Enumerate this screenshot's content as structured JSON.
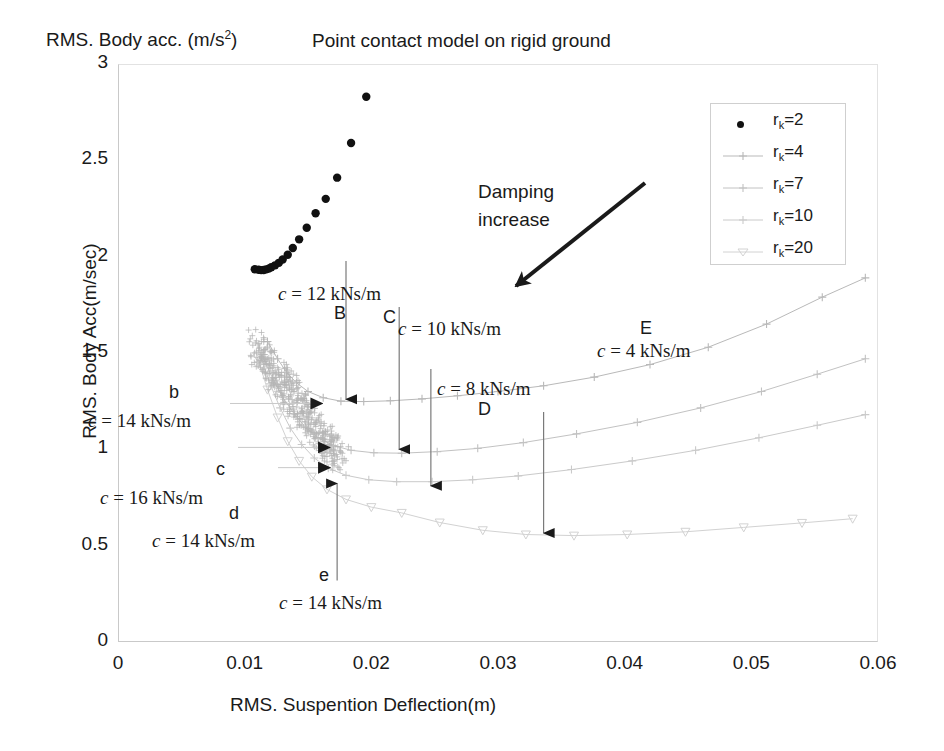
{
  "chart_data": {
    "type": "scatter",
    "title": "Point contact model on rigid ground",
    "xlabel": "RMS. Suspention Deflection(m)",
    "ylabel": "RMS. Body Acc(m/sec)",
    "ylabel_top": "RMS. Body acc. (m/s",
    "ylabel_top_sup": "2",
    "ylabel_top_close": ")",
    "xlim": [
      0,
      0.06
    ],
    "ylim": [
      0,
      3
    ],
    "xticks": [
      "0",
      "0.01",
      "0.02",
      "0.03",
      "0.04",
      "0.05",
      "0.06"
    ],
    "xtick_values": [
      0,
      0.01,
      0.02,
      0.03,
      0.04,
      0.05,
      0.06
    ],
    "yticks": [
      "0",
      "0.5",
      "1",
      "1.5",
      "2",
      "2.5",
      "3"
    ],
    "ytick_values": [
      0,
      0.5,
      1,
      1.5,
      2,
      2.5,
      3
    ],
    "grid": false,
    "legend_position": "upper right",
    "series": [
      {
        "name": "r_k=2",
        "label_base": "r",
        "label_sub": "k",
        "label_tail": "=2",
        "marker": "filled-circle",
        "color": "#111111",
        "points": [
          [
            0.0108,
            1.935
          ],
          [
            0.0111,
            1.932
          ],
          [
            0.0113,
            1.93
          ],
          [
            0.0115,
            1.931
          ],
          [
            0.0117,
            1.934
          ],
          [
            0.0119,
            1.938
          ],
          [
            0.0121,
            1.945
          ],
          [
            0.0124,
            1.955
          ],
          [
            0.0127,
            1.968
          ],
          [
            0.013,
            1.985
          ],
          [
            0.0134,
            2.01
          ],
          [
            0.0138,
            2.045
          ],
          [
            0.0143,
            2.09
          ],
          [
            0.0149,
            2.15
          ],
          [
            0.0156,
            2.225
          ],
          [
            0.0164,
            2.3
          ],
          [
            0.0173,
            2.41
          ],
          [
            0.0184,
            2.59
          ],
          [
            0.0196,
            2.83
          ]
        ]
      },
      {
        "name": "r_k=4",
        "label_base": "r",
        "label_sub": "k",
        "label_tail": "=4",
        "marker": "plus",
        "color": "#b9b9b9",
        "points": [
          [
            0.0118,
            1.56
          ],
          [
            0.0126,
            1.47
          ],
          [
            0.0133,
            1.4
          ],
          [
            0.0141,
            1.345
          ],
          [
            0.015,
            1.3
          ],
          [
            0.0162,
            1.268
          ],
          [
            0.0176,
            1.25
          ],
          [
            0.0194,
            1.248
          ],
          [
            0.0215,
            1.252
          ],
          [
            0.024,
            1.262
          ],
          [
            0.0268,
            1.278
          ],
          [
            0.03,
            1.3
          ],
          [
            0.0336,
            1.33
          ],
          [
            0.0376,
            1.375
          ],
          [
            0.042,
            1.44
          ],
          [
            0.0466,
            1.53
          ],
          [
            0.0512,
            1.65
          ],
          [
            0.0556,
            1.79
          ],
          [
            0.059,
            1.89
          ]
        ]
      },
      {
        "name": "r_k=7",
        "label_base": "r",
        "label_sub": "k",
        "label_tail": "=7",
        "marker": "plus",
        "color": "#c2c2c2",
        "points": [
          [
            0.0113,
            1.5
          ],
          [
            0.0122,
            1.37
          ],
          [
            0.013,
            1.27
          ],
          [
            0.0139,
            1.185
          ],
          [
            0.0148,
            1.115
          ],
          [
            0.0158,
            1.06
          ],
          [
            0.017,
            1.02
          ],
          [
            0.0184,
            0.995
          ],
          [
            0.0202,
            0.982
          ],
          [
            0.0224,
            0.98
          ],
          [
            0.0252,
            0.988
          ],
          [
            0.0284,
            1.005
          ],
          [
            0.032,
            1.035
          ],
          [
            0.0362,
            1.08
          ],
          [
            0.041,
            1.14
          ],
          [
            0.046,
            1.215
          ],
          [
            0.0508,
            1.3
          ],
          [
            0.0552,
            1.39
          ],
          [
            0.059,
            1.47
          ]
        ]
      },
      {
        "name": "r_k=10",
        "label_base": "r",
        "label_sub": "k",
        "label_tail": "=10",
        "marker": "plus",
        "color": "#cacaca",
        "points": [
          [
            0.0112,
            1.49
          ],
          [
            0.012,
            1.34
          ],
          [
            0.0128,
            1.215
          ],
          [
            0.0136,
            1.11
          ],
          [
            0.0145,
            1.025
          ],
          [
            0.0155,
            0.955
          ],
          [
            0.0166,
            0.902
          ],
          [
            0.018,
            0.865
          ],
          [
            0.0198,
            0.842
          ],
          [
            0.022,
            0.832
          ],
          [
            0.0248,
            0.832
          ],
          [
            0.028,
            0.842
          ],
          [
            0.0316,
            0.862
          ],
          [
            0.0358,
            0.895
          ],
          [
            0.0406,
            0.94
          ],
          [
            0.0456,
            0.995
          ],
          [
            0.0506,
            1.06
          ],
          [
            0.0552,
            1.125
          ],
          [
            0.059,
            1.18
          ]
        ]
      },
      {
        "name": "r_k=20",
        "label_base": "r",
        "label_sub": "k",
        "label_tail": "=20",
        "marker": "triangle-down",
        "color": "#d2d2d2",
        "points": [
          [
            0.011,
            1.48
          ],
          [
            0.0118,
            1.31
          ],
          [
            0.0126,
            1.165
          ],
          [
            0.0134,
            1.042
          ],
          [
            0.0143,
            0.94
          ],
          [
            0.0153,
            0.858
          ],
          [
            0.0165,
            0.792
          ],
          [
            0.018,
            0.74
          ],
          [
            0.02,
            0.7
          ],
          [
            0.0224,
            0.67
          ],
          [
            0.0254,
            0.62
          ],
          [
            0.0288,
            0.58
          ],
          [
            0.0322,
            0.558
          ],
          [
            0.036,
            0.552
          ],
          [
            0.0402,
            0.558
          ],
          [
            0.0448,
            0.572
          ],
          [
            0.0494,
            0.595
          ],
          [
            0.054,
            0.618
          ],
          [
            0.058,
            0.64
          ]
        ]
      }
    ],
    "annotations": [
      {
        "id": "B",
        "letter": "B",
        "damping": "c = 12 kNs/m",
        "x": 0.018,
        "y_point": 1.25,
        "arrow": "down"
      },
      {
        "id": "C",
        "letter": "C",
        "damping": "c = 10 kNs/m",
        "x": 0.0222,
        "y_point": 0.99,
        "arrow": "down"
      },
      {
        "id": "D",
        "letter": "D",
        "damping": "c = 8 kNs/m",
        "x": 0.0247,
        "y_point": 0.8,
        "arrow": "down"
      },
      {
        "id": "E",
        "letter": "E",
        "damping": "c = 4 kNs/m",
        "x": 0.0336,
        "y_point": 0.555,
        "arrow": "down"
      },
      {
        "id": "b",
        "letter": "b",
        "damping": "c = 14 kNs/m",
        "x": 0.0163,
        "y_point": 1.238,
        "arrow": "right"
      },
      {
        "id": "c",
        "letter": "c",
        "damping": "c = 16 kNs/m",
        "x": 0.0169,
        "y_point": 1.01,
        "arrow": "right"
      },
      {
        "id": "d",
        "letter": "d",
        "damping": "c = 14 kNs/m",
        "x": 0.0169,
        "y_point": 0.905,
        "arrow": "right"
      },
      {
        "id": "e",
        "letter": "e",
        "damping": "c = 14 kNs/m",
        "x": 0.0173,
        "y_point": 0.838,
        "arrow": "up"
      }
    ],
    "damping_note": {
      "line1": "Damping",
      "line2": "increase"
    }
  },
  "colors": {
    "axis": "#c9c9c9",
    "text": "#1a1a1a",
    "legend_border": "#cfcfcf",
    "series_dark": "#111111",
    "series_faint": "#c6c6c6"
  }
}
